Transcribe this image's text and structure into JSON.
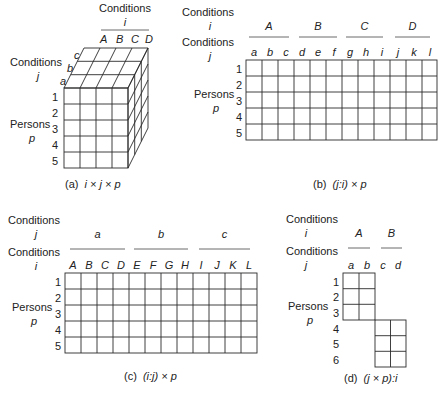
{
  "panels": {
    "a": {
      "caption_prefix": "(a)",
      "caption_formula": "i × j × p",
      "top_facet_label": "Conditions",
      "top_facet_symbol": "i",
      "top_levels": [
        "A",
        "B",
        "C",
        "D"
      ],
      "side_facet_label": "Conditions",
      "side_facet_symbol": "j",
      "side_levels": [
        "a",
        "b",
        "c"
      ],
      "row_facet_label": "Persons",
      "row_facet_symbol": "p",
      "rows": [
        "1",
        "2",
        "3",
        "4",
        "5"
      ]
    },
    "b": {
      "caption_prefix": "(b)",
      "caption_formula": "(j:i) × p",
      "outer_label": "Conditions",
      "outer_symbol": "i",
      "outer_levels": [
        "A",
        "B",
        "C",
        "D"
      ],
      "inner_label": "Conditions",
      "inner_symbol": "j",
      "inner_levels": [
        "a",
        "b",
        "c",
        "d",
        "e",
        "f",
        "g",
        "h",
        "i",
        "j",
        "k",
        "l"
      ],
      "row_facet_label": "Persons",
      "row_facet_symbol": "p",
      "rows": [
        "1",
        "2",
        "3",
        "4",
        "5"
      ]
    },
    "c": {
      "caption_prefix": "(c)",
      "caption_formula": "(i:j) × p",
      "outer_label": "Conditions",
      "outer_symbol": "j",
      "outer_levels": [
        "a",
        "b",
        "c"
      ],
      "inner_label": "Conditions",
      "inner_symbol": "i",
      "inner_levels": [
        "A",
        "B",
        "C",
        "D",
        "E",
        "F",
        "G",
        "H",
        "I",
        "J",
        "K",
        "L"
      ],
      "row_facet_label": "Persons",
      "row_facet_symbol": "p",
      "rows": [
        "1",
        "2",
        "3",
        "4",
        "5"
      ]
    },
    "d": {
      "caption_prefix": "(d)",
      "caption_formula": "(j × p):i",
      "outer_label": "Conditions",
      "outer_symbol": "i",
      "outer_levels": [
        "A",
        "B"
      ],
      "inner_label": "Conditions",
      "inner_symbol": "j",
      "inner_levels": [
        "a",
        "b",
        "c",
        "d"
      ],
      "row_facet_label": "Persons",
      "row_facet_symbol": "p",
      "rows": [
        "1",
        "2",
        "3",
        "4",
        "5",
        "6"
      ]
    }
  }
}
